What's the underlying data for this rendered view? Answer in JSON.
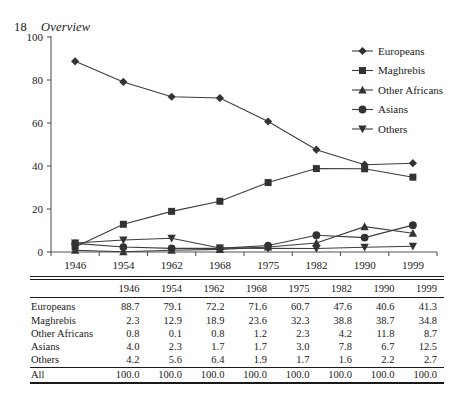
{
  "page": {
    "folio": "18",
    "running_title": "Overview"
  },
  "chart_data": {
    "type": "line",
    "title": "",
    "xlabel": "",
    "ylabel": "",
    "ylim": [
      0,
      100
    ],
    "yticks": [
      0,
      20,
      40,
      60,
      80,
      100
    ],
    "grid": false,
    "legend_position": "top-right",
    "categories": [
      "1946",
      "1954",
      "1962",
      "1968",
      "1975",
      "1982",
      "1990",
      "1999"
    ],
    "series": [
      {
        "name": "Europeans",
        "marker": "diamond",
        "values": [
          88.7,
          79.1,
          72.2,
          71.6,
          60.7,
          47.6,
          40.6,
          41.3
        ]
      },
      {
        "name": "Maghrebis",
        "marker": "square",
        "values": [
          2.3,
          12.9,
          18.9,
          23.6,
          32.3,
          38.8,
          38.7,
          34.8
        ]
      },
      {
        "name": "Other Africans",
        "marker": "triangle-up",
        "values": [
          0.8,
          0.1,
          0.8,
          1.2,
          2.3,
          4.2,
          11.8,
          8.7
        ]
      },
      {
        "name": "Asians",
        "marker": "circle",
        "values": [
          4.0,
          2.3,
          1.7,
          1.7,
          3.0,
          7.8,
          6.7,
          12.5
        ]
      },
      {
        "name": "Others",
        "marker": "triangle-down",
        "values": [
          4.2,
          5.6,
          6.4,
          1.9,
          1.7,
          1.6,
          2.2,
          2.7
        ]
      }
    ],
    "colors": {
      "line": "#3c3c3c",
      "marker": "#333333",
      "axis": "#555555",
      "text": "#1a1a1a"
    }
  },
  "table": {
    "columns": [
      "",
      "1946",
      "1954",
      "1962",
      "1968",
      "1975",
      "1982",
      "1990",
      "1999"
    ],
    "rows": [
      {
        "label": "Europeans",
        "values": [
          "88.7",
          "79.1",
          "72.2",
          "71.6",
          "60.7",
          "47.6",
          "40.6",
          "41.3"
        ]
      },
      {
        "label": "Maghrebis",
        "values": [
          "2.3",
          "12.9",
          "18.9",
          "23.6",
          "32.3",
          "38.8",
          "38.7",
          "34.8"
        ]
      },
      {
        "label": "Other Africans",
        "values": [
          "0.8",
          "0.1",
          "0.8",
          "1.2",
          "2.3",
          "4.2",
          "11.8",
          "8.7"
        ]
      },
      {
        "label": "Asians",
        "values": [
          "4.0",
          "2.3",
          "1.7",
          "1.7",
          "3.0",
          "7.8",
          "6.7",
          "12.5"
        ]
      },
      {
        "label": "Others",
        "values": [
          "4.2",
          "5.6",
          "6.4",
          "1.9",
          "1.7",
          "1.6",
          "2.2",
          "2.7"
        ]
      },
      {
        "label": "All",
        "values": [
          "100.0",
          "100.0",
          "100.0",
          "100.0",
          "100.0",
          "100.0",
          "100.0",
          "100.0"
        ]
      }
    ]
  }
}
